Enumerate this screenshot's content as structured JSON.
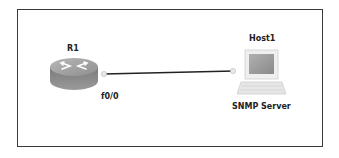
{
  "diagram": {
    "type": "network-topology",
    "nodes": [
      {
        "id": "R1",
        "label": "R1",
        "kind": "router",
        "icon": "router-icon",
        "interface_label": "f0/0"
      },
      {
        "id": "Host1",
        "label": "Host1",
        "kind": "host",
        "icon": "computer-icon",
        "role_label": "SNMP Server"
      }
    ],
    "links": [
      {
        "from": "R1",
        "to": "Host1",
        "from_interface": "f0/0",
        "style": "solid"
      }
    ],
    "colors": {
      "frame": "#3a3a3a",
      "link": "#222222",
      "router_body": "#8a8a8a",
      "router_top": "#a6a6a6",
      "monitor_screen": "#9c9c9c",
      "host_body": "#e6e6e6"
    }
  }
}
